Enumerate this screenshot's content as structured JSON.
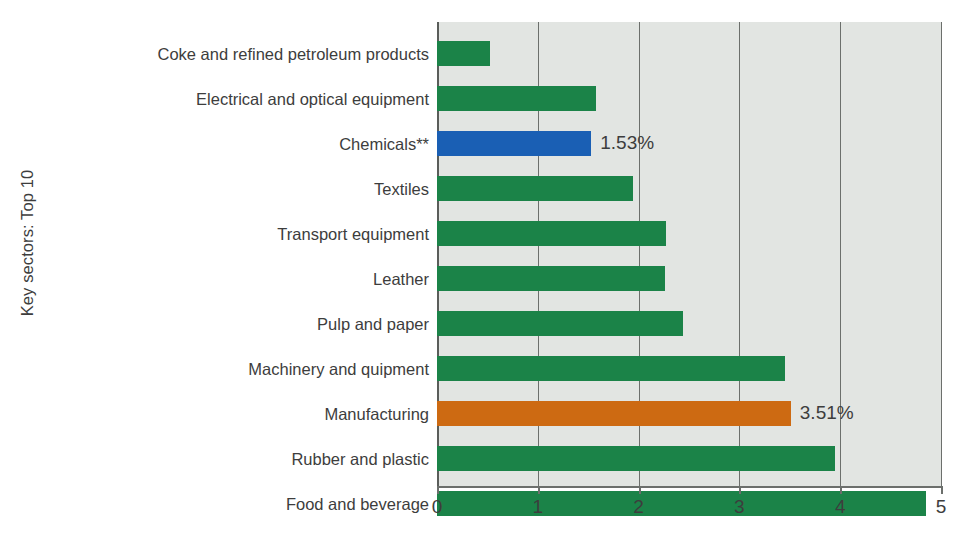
{
  "chart_data": {
    "type": "bar",
    "orientation": "horizontal",
    "title": "",
    "xlabel": "",
    "ylabel": "Key sectors: Top 10",
    "xlim": [
      0,
      5
    ],
    "xticks": [
      "0",
      "1",
      "2",
      "3",
      "4",
      "5"
    ],
    "grid": true,
    "legend": "none",
    "categories": [
      "Coke and refined petroleum products",
      "Electrical and optical equipment",
      "Chemicals**",
      "Textiles",
      "Transport equipment",
      "Leather",
      "Pulp and paper",
      "Machinery and quipment",
      "Manufacturing",
      "Rubber and plastic",
      "Food and beverage"
    ],
    "values": [
      0.53,
      1.58,
      1.53,
      1.94,
      2.27,
      2.26,
      2.44,
      3.45,
      3.51,
      3.95,
      4.85
    ],
    "bar_colors": [
      "#1b8348",
      "#1b8348",
      "#1a5fb4",
      "#1b8348",
      "#1b8348",
      "#1b8348",
      "#1b8348",
      "#1b8348",
      "#cd6a12",
      "#1b8348",
      "#1b8348"
    ],
    "annotations": [
      {
        "category": "Chemicals**",
        "text": "1.53%"
      },
      {
        "category": "Manufacturing",
        "text": "3.51%"
      }
    ],
    "colors": {
      "green": "#1b8348",
      "blue": "#1a5fb4",
      "orange": "#cd6a12",
      "plot_background": "#e2e5e2",
      "axis": "#6c6f6c",
      "text": "#3d3d3d"
    }
  }
}
